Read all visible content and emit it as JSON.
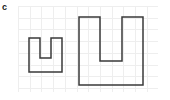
{
  "figure": {
    "panel_label": "c",
    "width": 170,
    "height": 100,
    "background_color": "#ffffff"
  },
  "grid": {
    "label": "grid-background",
    "x": 18,
    "y": 6,
    "width": 140,
    "height": 86,
    "cell_size": 11.7,
    "line_color": "#eeeeee",
    "line_width": 1
  },
  "shapes": {
    "stroke_color": "#3a3a3a",
    "stroke_width": 1.5,
    "fill": "none",
    "items": [
      {
        "name": "small-u-shape",
        "label": "small U polygon",
        "points": "29,38 40,38 40,58 51,58 51,38 62,38 62,72 29,72",
        "bounds": {
          "left": 29,
          "top": 38,
          "right": 62,
          "bottom": 72
        },
        "notch": {
          "left": 40,
          "right": 51,
          "bottom": 58
        }
      },
      {
        "name": "large-u-shape",
        "label": "large U polygon",
        "points": "79,17 100,17 100,61 122,61 122,17 143,17 143,85 79,85",
        "bounds": {
          "left": 79,
          "top": 17,
          "right": 143,
          "bottom": 85
        },
        "notch": {
          "left": 100,
          "right": 122,
          "bottom": 61
        }
      }
    ]
  }
}
